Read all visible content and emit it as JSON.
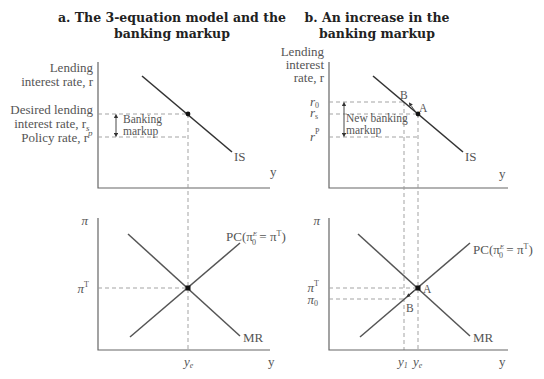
{
  "panels": [
    {
      "id": "a",
      "title_line1": "a. The 3-equation model and the",
      "title_line2": "banking markup",
      "top": {
        "y_label_line1": "Lending",
        "y_label_line2": "interest rate, r",
        "rs_label_line1": "Desired lending",
        "rs_label_line2": "interest rate, r",
        "rs_sub": "s",
        "rp_label": "Policy rate, r",
        "rp_sup": "p",
        "markup_line1": "Banking",
        "markup_line2": "markup",
        "curve_label": "IS",
        "x_label": "y"
      },
      "bottom": {
        "y_label": "π",
        "pit_label": "π",
        "pit_sup": "T",
        "pc_label": "PC(π",
        "pc_sup": "E",
        "pc_sub": "0",
        "pc_rest": " = π",
        "pc_rest_sup": "T",
        "pc_close": ")",
        "mr_label": "MR",
        "ye_label": "y",
        "ye_sub": "e",
        "x_label": "y"
      }
    },
    {
      "id": "b",
      "title_line1": "b. An increase in the",
      "title_line2": "banking markup",
      "top": {
        "y_label_line1": "Lending",
        "y_label_line2": "interest",
        "y_label_line3": "rate, r",
        "r0_label": "r",
        "r0_sub": "0",
        "rs_label": "r",
        "rs_sub": "s",
        "rp_label": "r",
        "rp_sup": "P",
        "markup_line1": "New banking",
        "markup_line2": "markup",
        "point_a": "A",
        "point_b": "B",
        "curve_label": "IS",
        "x_label": "y"
      },
      "bottom": {
        "y_label": "π",
        "pit_label": "π",
        "pit_sup": "T",
        "pi0_label": "π",
        "pi0_sub": "0",
        "pc_label": "PC(π",
        "pc_sup": "E",
        "pc_sub": "0",
        "pc_rest": " = π",
        "pc_rest_sup": "T",
        "pc_close": ")",
        "mr_label": "MR",
        "point_a": "A",
        "point_b": "B",
        "y1_label": "y",
        "y1_sub": "1",
        "ye_label": "y",
        "ye_sub": "e",
        "x_label": "y"
      }
    }
  ]
}
